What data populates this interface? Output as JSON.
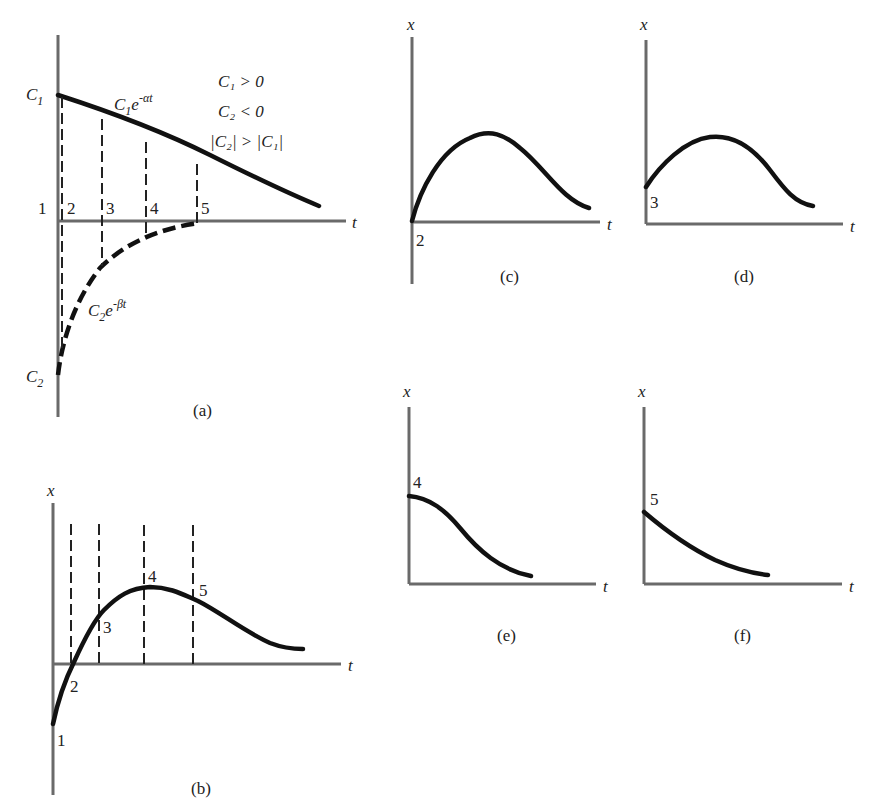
{
  "figure": {
    "panels": {
      "a": {
        "caption": "(a)",
        "axis_t": "t",
        "c1_label": "C",
        "c1_sub": "1",
        "c2_label": "C",
        "c2_sub": "2",
        "curve1_base": "C",
        "curve1_sub": "1",
        "curve1_e": "e",
        "curve1_exp": "-αt",
        "curve2_base": "C",
        "curve2_sub": "2",
        "curve2_e": "e",
        "curve2_exp": "-βt",
        "cond1": "C₁ > 0",
        "cond2": "C₂ < 0",
        "cond3": "|C₂| > |C₁|",
        "points": [
          "1",
          "2",
          "3",
          "4",
          "5"
        ]
      },
      "b": {
        "caption": "(b)",
        "axis_x": "x",
        "axis_t": "t",
        "points": [
          "1",
          "2",
          "3",
          "4",
          "5"
        ]
      },
      "c": {
        "caption": "(c)",
        "axis_x": "x",
        "axis_t": "t",
        "start_label": "2"
      },
      "d": {
        "caption": "(d)",
        "axis_x": "x",
        "axis_t": "t",
        "start_label": "3"
      },
      "e": {
        "caption": "(e)",
        "axis_x": "x",
        "axis_t": "t",
        "start_label": "4"
      },
      "f": {
        "caption": "(f)",
        "axis_x": "x",
        "axis_t": "t",
        "start_label": "5"
      }
    }
  },
  "colors": {
    "axis": "#6a6a6a",
    "curve": "#111111",
    "background": "#ffffff"
  }
}
